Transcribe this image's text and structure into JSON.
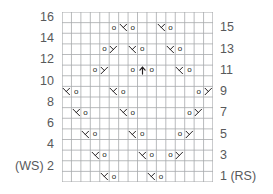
{
  "chart_data": {
    "type": "table",
    "title": "",
    "columns": 16,
    "rows": 16,
    "grid": true,
    "left_axis_labels": [
      "16",
      "14",
      "12",
      "10",
      "8",
      "6",
      "4",
      "(WS) 2"
    ],
    "right_axis_labels": [
      "15",
      "13",
      "11",
      "9",
      "7",
      "5",
      "3",
      "1 (RS)"
    ],
    "legend": [],
    "symbol_names": {
      "o": "yarn-over",
      "k2tog": "knit-two-together-right-slant",
      "ssk": "slip-slip-knit-left-slant",
      "cdd": "central-double-decrease"
    },
    "row_order_top_to_bottom": [
      16,
      15,
      14,
      13,
      12,
      11,
      10,
      9,
      8,
      7,
      6,
      5,
      4,
      3,
      2,
      1
    ],
    "cells": [
      {
        "row": 15,
        "col": 6,
        "symbol": "o"
      },
      {
        "row": 15,
        "col": 7,
        "symbol": "k2tog"
      },
      {
        "row": 15,
        "col": 8,
        "symbol": "o"
      },
      {
        "row": 15,
        "col": 11,
        "symbol": "k2tog"
      },
      {
        "row": 15,
        "col": 12,
        "symbol": "o"
      },
      {
        "row": 13,
        "col": 5,
        "symbol": "o"
      },
      {
        "row": 13,
        "col": 6,
        "symbol": "ssk"
      },
      {
        "row": 13,
        "col": 8,
        "symbol": "k2tog"
      },
      {
        "row": 13,
        "col": 9,
        "symbol": "o"
      },
      {
        "row": 13,
        "col": 12,
        "symbol": "k2tog"
      },
      {
        "row": 13,
        "col": 13,
        "symbol": "o"
      },
      {
        "row": 11,
        "col": 4,
        "symbol": "o"
      },
      {
        "row": 11,
        "col": 5,
        "symbol": "ssk"
      },
      {
        "row": 11,
        "col": 8,
        "symbol": "o"
      },
      {
        "row": 11,
        "col": 9,
        "symbol": "cdd"
      },
      {
        "row": 11,
        "col": 10,
        "symbol": "o"
      },
      {
        "row": 11,
        "col": 13,
        "symbol": "k2tog"
      },
      {
        "row": 11,
        "col": 14,
        "symbol": "o"
      },
      {
        "row": 9,
        "col": 1,
        "symbol": "k2tog"
      },
      {
        "row": 9,
        "col": 2,
        "symbol": "o"
      },
      {
        "row": 9,
        "col": 6,
        "symbol": "k2tog"
      },
      {
        "row": 9,
        "col": 7,
        "symbol": "o"
      },
      {
        "row": 9,
        "col": 15,
        "symbol": "o"
      },
      {
        "row": 9,
        "col": 16,
        "symbol": "ssk"
      },
      {
        "row": 7,
        "col": 2,
        "symbol": "k2tog"
      },
      {
        "row": 7,
        "col": 3,
        "symbol": "o"
      },
      {
        "row": 7,
        "col": 7,
        "symbol": "k2tog"
      },
      {
        "row": 7,
        "col": 8,
        "symbol": "o"
      },
      {
        "row": 7,
        "col": 14,
        "symbol": "o"
      },
      {
        "row": 7,
        "col": 15,
        "symbol": "ssk"
      },
      {
        "row": 5,
        "col": 3,
        "symbol": "k2tog"
      },
      {
        "row": 5,
        "col": 4,
        "symbol": "o"
      },
      {
        "row": 5,
        "col": 8,
        "symbol": "k2tog"
      },
      {
        "row": 5,
        "col": 9,
        "symbol": "o"
      },
      {
        "row": 5,
        "col": 13,
        "symbol": "o"
      },
      {
        "row": 5,
        "col": 14,
        "symbol": "ssk"
      },
      {
        "row": 3,
        "col": 4,
        "symbol": "k2tog"
      },
      {
        "row": 3,
        "col": 5,
        "symbol": "o"
      },
      {
        "row": 3,
        "col": 9,
        "symbol": "k2tog"
      },
      {
        "row": 3,
        "col": 10,
        "symbol": "o"
      },
      {
        "row": 3,
        "col": 12,
        "symbol": "o"
      },
      {
        "row": 3,
        "col": 13,
        "symbol": "ssk"
      },
      {
        "row": 1,
        "col": 5,
        "symbol": "k2tog"
      },
      {
        "row": 1,
        "col": 6,
        "symbol": "o"
      },
      {
        "row": 1,
        "col": 10,
        "symbol": "k2tog"
      },
      {
        "row": 1,
        "col": 11,
        "symbol": "o"
      }
    ],
    "colors": {
      "grid_line": "#a7a9ac",
      "symbol": "#231f20",
      "label_text": "#58595b",
      "background": "#ffffff"
    }
  }
}
